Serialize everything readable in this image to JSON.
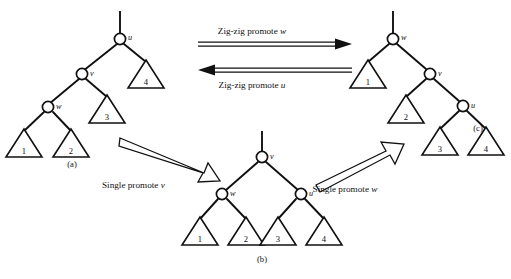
{
  "figure": {
    "type": "splay-tree-rotation-diagram",
    "background_color": "#ffffff",
    "ink_color": "#111111",
    "panels": [
      {
        "id": "a",
        "label": "(a)",
        "description": "left-leaning zig-zig configuration",
        "nodes": [
          {
            "name": "u",
            "label": "u"
          },
          {
            "name": "v",
            "label": "v"
          },
          {
            "name": "w",
            "label": "w"
          }
        ],
        "subtrees": [
          {
            "label": "1"
          },
          {
            "label": "2"
          },
          {
            "label": "3"
          },
          {
            "label": "4"
          }
        ]
      },
      {
        "id": "b",
        "label": "(b)",
        "description": "balanced intermediate configuration",
        "nodes": [
          {
            "name": "v",
            "label": "v"
          },
          {
            "name": "w",
            "label": "w"
          },
          {
            "name": "u",
            "label": "u"
          }
        ],
        "subtrees": [
          {
            "label": "1"
          },
          {
            "label": "2"
          },
          {
            "label": "3"
          },
          {
            "label": "4"
          }
        ]
      },
      {
        "id": "c",
        "label": "(c)",
        "description": "right-leaning zig-zig configuration",
        "nodes": [
          {
            "name": "w",
            "label": "w"
          },
          {
            "name": "v",
            "label": "v"
          },
          {
            "name": "u",
            "label": "u"
          }
        ],
        "subtrees": [
          {
            "label": "1"
          },
          {
            "label": "2"
          },
          {
            "label": "3"
          },
          {
            "label": "4"
          }
        ]
      }
    ],
    "arrows": [
      {
        "id": "zigzig-w",
        "direction": "right",
        "style": "double-line",
        "caption_prefix": "Zig-zig promote ",
        "caption_var": "w"
      },
      {
        "id": "zigzig-u",
        "direction": "left",
        "style": "double-line",
        "caption_prefix": "Zig-zig promote ",
        "caption_var": "u"
      },
      {
        "id": "single-v",
        "direction": "down-right",
        "style": "outline-block",
        "caption_prefix": "Single promote ",
        "caption_var": "v"
      },
      {
        "id": "single-w",
        "direction": "up-right",
        "style": "outline-block",
        "caption_prefix": "Single promote ",
        "caption_var": "w"
      }
    ]
  }
}
